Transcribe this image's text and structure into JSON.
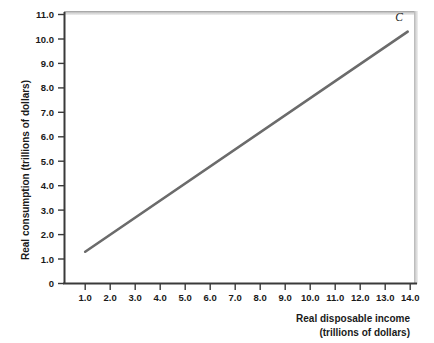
{
  "chart_data": {
    "type": "line",
    "title": "",
    "subtitle": "",
    "xlabel": "Real disposable income",
    "xlabel_line2": "(trillions of dollars)",
    "ylabel": "Real consumption (trillions of dollars)",
    "xlim": [
      0.0,
      14.6
    ],
    "ylim": [
      0.0,
      11.0
    ],
    "grid": false,
    "legend": null,
    "xticks": [
      "1.0",
      "2.0",
      "3.0",
      "4.0",
      "5.0",
      "6.0",
      "7.0",
      "8.0",
      "9.0",
      "10.0",
      "11.0",
      "12.0",
      "13.0",
      "14.0"
    ],
    "xtick_values": [
      1.0,
      2.0,
      3.0,
      4.0,
      5.0,
      6.0,
      7.0,
      8.0,
      9.0,
      10.0,
      11.0,
      12.0,
      13.0,
      14.0
    ],
    "yticks": [
      "0",
      "1.0",
      "2.0",
      "3.0",
      "4.0",
      "5.0",
      "6.0",
      "7.0",
      "8.0",
      "9.0",
      "10.0",
      "11.0"
    ],
    "ytick_values": [
      0.0,
      1.0,
      2.0,
      3.0,
      4.0,
      5.0,
      6.0,
      7.0,
      8.0,
      9.0,
      10.0,
      11.0
    ],
    "series": [
      {
        "name": "C",
        "label": "C",
        "color": "#6b6b6b",
        "x": [
          1.0,
          13.9
        ],
        "values": [
          1.3,
          10.3
        ],
        "annotation": "C"
      }
    ],
    "annotations": [
      {
        "text": "C",
        "x": 13.4,
        "y": 10.75
      }
    ],
    "colors": {
      "line": "#6b6b6b",
      "axis": "#3a3a3a",
      "frame": "#c8c8c8",
      "background": "#ffffff",
      "text": "#1a1a1a"
    }
  }
}
